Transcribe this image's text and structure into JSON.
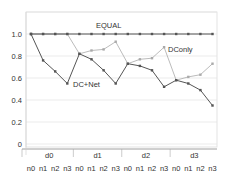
{
  "chart_data": {
    "type": "line",
    "title": "",
    "xlabel": "",
    "ylabel": "",
    "ylim": [
      0,
      1.15
    ],
    "grid": true,
    "yticks": [
      "0",
      "0.2",
      "0.4",
      "0.6",
      "0.8",
      "1.0"
    ],
    "ytick_values": [
      0,
      0.2,
      0.4,
      0.6,
      0.8,
      1.0
    ],
    "group_labels": [
      "d0",
      "d1",
      "d2",
      "d3"
    ],
    "categories": [
      "n0",
      "n1",
      "n2",
      "n3",
      "n0",
      "n1",
      "n2",
      "n3",
      "n0",
      "n1",
      "n2",
      "n3",
      "n0",
      "n1",
      "n2",
      "n3"
    ],
    "series": [
      {
        "name": "EQUAL",
        "color": "#555555",
        "values": [
          1.0,
          1.0,
          1.0,
          1.0,
          1.0,
          1.0,
          1.0,
          1.0,
          1.0,
          1.0,
          1.0,
          1.0,
          1.0,
          1.0,
          1.0,
          1.0
        ]
      },
      {
        "name": "DConly",
        "color": "#aaaaaa",
        "values": [
          1.0,
          1.0,
          1.0,
          1.0,
          0.82,
          0.85,
          0.86,
          0.93,
          0.73,
          0.77,
          0.78,
          0.88,
          0.58,
          0.61,
          0.63,
          0.73
        ]
      },
      {
        "name": "DC+Net",
        "color": "#555555",
        "values": [
          1.0,
          0.76,
          0.66,
          0.55,
          0.82,
          0.77,
          0.67,
          0.55,
          0.73,
          0.71,
          0.67,
          0.52,
          0.58,
          0.55,
          0.49,
          0.35
        ]
      }
    ],
    "annotations": [
      {
        "text": "EQUAL",
        "near_series": "EQUAL"
      },
      {
        "text": "DConly",
        "near_series": "DConly"
      },
      {
        "text": "DC+Net",
        "near_series": "DC+Net"
      }
    ],
    "legend": "inline annotations"
  },
  "colors": {
    "gridline": "#e6e6e6",
    "frame": "#dddddd",
    "axis": "#888888"
  }
}
